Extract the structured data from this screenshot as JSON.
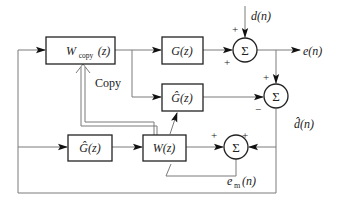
{
  "diagram": {
    "type": "block-diagram",
    "title_visible": false,
    "blocks": [
      {
        "id": "wcopy",
        "label_main": "W",
        "label_sub": "copy",
        "label_arg": "(z)"
      },
      {
        "id": "plant",
        "label": "G(z)"
      },
      {
        "id": "plant_est_upper",
        "label": "Ĝ(z)"
      },
      {
        "id": "plant_est_lower",
        "label": "Ĝ(z)"
      },
      {
        "id": "adaptive",
        "label": "W(z)"
      }
    ],
    "summers": [
      {
        "id": "sum1",
        "symbol": "Σ",
        "signs": [
          "+",
          "+"
        ]
      },
      {
        "id": "sum2",
        "symbol": "Σ",
        "signs": [
          "+",
          "−"
        ]
      },
      {
        "id": "sum3",
        "symbol": "Σ",
        "signs": [
          "+",
          "+"
        ]
      }
    ],
    "signals": {
      "disturbance": "d(n)",
      "error": "e(n)",
      "disturbance_estimate": "d̂(n)",
      "model_error_main": "e",
      "model_error_sub": "m",
      "model_error_arg": "(n)"
    },
    "annotations": {
      "copy": "Copy"
    },
    "colors": {
      "line": "#7a7a7a",
      "box_border": "#222222",
      "arrow": "#111111",
      "text": "#222222",
      "background": "#ffffff"
    }
  }
}
